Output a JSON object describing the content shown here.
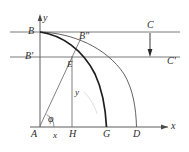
{
  "figure": {
    "background_color": "#ffffff",
    "stroke_color": "#3a3a3a",
    "thick_stroke_color": "#1a1a1a",
    "label_color": "#2b2b2b",
    "width": 189,
    "height": 152
  },
  "axes": {
    "origin_label": "A",
    "x_axis_label": "x",
    "y_axis_label": "y",
    "x_axis_y_px": 127,
    "y_axis_x_px": 40
  },
  "labels": {
    "A": "A",
    "B": "B",
    "B_prime": "B'",
    "B_double_prime": "B″",
    "C": "C",
    "C_prime": "C'",
    "D": "D",
    "E": "E",
    "G": "G",
    "H": "H",
    "x_small": "x",
    "y_small": "y",
    "y_axis": "y",
    "x_axis": "x",
    "phi": "φ"
  },
  "points": [
    {
      "name": "A",
      "label": "A",
      "x": 40,
      "y": 127
    },
    {
      "name": "B",
      "label": "B",
      "x": 40,
      "y": 32
    },
    {
      "name": "B-prime",
      "label": "B'",
      "x": 40,
      "y": 57
    },
    {
      "name": "B-double-prime",
      "label": "B″",
      "x": 80,
      "y": 39
    },
    {
      "name": "E",
      "label": "E",
      "x": 72,
      "y": 57
    },
    {
      "name": "H",
      "label": "H",
      "x": 72,
      "y": 127
    },
    {
      "name": "G",
      "label": "G",
      "x": 106,
      "y": 127
    },
    {
      "name": "D",
      "label": "D",
      "x": 136,
      "y": 127
    },
    {
      "name": "C",
      "label": "C",
      "x": 150,
      "y": 32
    },
    {
      "name": "C-prime",
      "label": "C'",
      "x": 150,
      "y": 57
    }
  ],
  "horizontal_lines": [
    {
      "name": "line-B-C",
      "y": 32,
      "x_start": 10,
      "x_end": 180
    },
    {
      "name": "line-Bprime-Cprime",
      "y": 57,
      "x_start": 10,
      "x_end": 180
    }
  ],
  "curves": [
    {
      "name": "curve-B-to-G",
      "from": "B",
      "to": "G",
      "weight": "thick"
    },
    {
      "name": "curve-B-to-D",
      "from": "B",
      "to": "D",
      "weight": "thin"
    }
  ],
  "segments": [
    {
      "name": "ray-A-to-Bdoubleprime",
      "from": "A",
      "to": "B″"
    },
    {
      "name": "ordinate-H-to-E",
      "from": "H",
      "to": "E"
    },
    {
      "name": "drop-arrow-C-to-Cprime",
      "from": "C",
      "to": "C'"
    }
  ],
  "angle": {
    "name": "angle-phi-at-A",
    "symbol": "φ",
    "vertex": "A"
  }
}
